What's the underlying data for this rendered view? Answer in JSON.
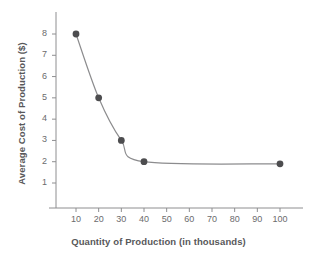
{
  "chart_data": {
    "type": "line",
    "title": "",
    "subtitle": "",
    "xlabel": "Quantity of Production (in thousands)",
    "ylabel": "Average Cost of Production ($)",
    "x": [
      10,
      20,
      30,
      40,
      100
    ],
    "values": [
      8,
      5,
      3,
      2,
      1.9
    ],
    "series": [
      {
        "name": "Average cost",
        "x": [
          10,
          20,
          30,
          40,
          100
        ],
        "values": [
          8,
          5,
          3,
          2,
          1.9
        ]
      }
    ],
    "xlim": [
      0,
      110
    ],
    "ylim": [
      0,
      8.8
    ],
    "xticks": [
      10,
      20,
      30,
      40,
      50,
      60,
      70,
      80,
      90,
      100
    ],
    "xtick_labels": [
      "10",
      "20",
      "30",
      "40",
      "50",
      "60",
      "70",
      "80",
      "90",
      "100"
    ],
    "yticks": [
      1,
      2,
      3,
      4,
      5,
      6,
      7,
      8
    ],
    "ytick_labels": [
      "1",
      "2",
      "3",
      "4",
      "5",
      "6",
      "7",
      "8"
    ],
    "grid": false,
    "legend": false,
    "legend_position": "none",
    "marker": "circle",
    "marker_color": "#4d4d4f",
    "line_color": "#8c8c8e",
    "axis_color": "#8e8e90",
    "background": "#ffffff"
  }
}
